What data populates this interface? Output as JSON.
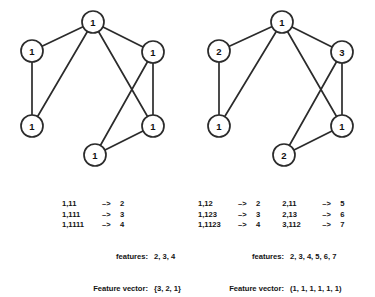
{
  "figure": {
    "background_color": "#ffffff",
    "ink_color": "#2b2b2b"
  },
  "graphs": [
    {
      "id": "left-graph",
      "name": "graph-left",
      "nodes": [
        {
          "id": "n-top",
          "label": "1",
          "cx": 93,
          "cy": 22,
          "r": 11
        },
        {
          "id": "n-upper-left",
          "label": "1",
          "cx": 32,
          "cy": 51,
          "r": 11
        },
        {
          "id": "n-upper-right",
          "label": "1",
          "cx": 153,
          "cy": 52,
          "r": 11
        },
        {
          "id": "n-lower-left",
          "label": "1",
          "cx": 32,
          "cy": 126,
          "r": 11
        },
        {
          "id": "n-lower-right",
          "label": "1",
          "cx": 153,
          "cy": 126,
          "r": 11
        },
        {
          "id": "n-bottom",
          "label": "1",
          "cx": 95,
          "cy": 155,
          "r": 11
        }
      ],
      "edges": [
        {
          "from": "n-top",
          "to": "n-upper-left"
        },
        {
          "from": "n-top",
          "to": "n-upper-right"
        },
        {
          "from": "n-top",
          "to": "n-lower-left"
        },
        {
          "from": "n-top",
          "to": "n-lower-right"
        },
        {
          "from": "n-upper-left",
          "to": "n-lower-left"
        },
        {
          "from": "n-upper-right",
          "to": "n-lower-right"
        },
        {
          "from": "n-upper-right",
          "to": "n-bottom"
        },
        {
          "from": "n-lower-right",
          "to": "n-bottom"
        }
      ]
    },
    {
      "id": "right-graph",
      "name": "graph-right",
      "nodes": [
        {
          "id": "n-top",
          "label": "1",
          "cx": 95,
          "cy": 22,
          "r": 11
        },
        {
          "id": "n-upper-left",
          "label": "2",
          "cx": 32,
          "cy": 51,
          "r": 11
        },
        {
          "id": "n-upper-right",
          "label": "3",
          "cx": 155,
          "cy": 52,
          "r": 11
        },
        {
          "id": "n-lower-left",
          "label": "1",
          "cx": 32,
          "cy": 126,
          "r": 11
        },
        {
          "id": "n-lower-right",
          "label": "1",
          "cx": 155,
          "cy": 126,
          "r": 11
        },
        {
          "id": "n-bottom",
          "label": "2",
          "cx": 97,
          "cy": 155,
          "r": 11
        }
      ],
      "edges": [
        {
          "from": "n-top",
          "to": "n-upper-left"
        },
        {
          "from": "n-top",
          "to": "n-upper-right"
        },
        {
          "from": "n-top",
          "to": "n-lower-left"
        },
        {
          "from": "n-top",
          "to": "n-lower-right"
        },
        {
          "from": "n-upper-left",
          "to": "n-lower-left"
        },
        {
          "from": "n-upper-right",
          "to": "n-lower-right"
        },
        {
          "from": "n-upper-right",
          "to": "n-bottom"
        },
        {
          "from": "n-lower-right",
          "to": "n-bottom"
        }
      ]
    }
  ],
  "captions": {
    "left": {
      "rules_col1": [
        {
          "pattern": "1,11",
          "arrow": "–> ",
          "result": "2"
        },
        {
          "pattern": "1,111",
          "arrow": "–> ",
          "result": "3"
        },
        {
          "pattern": "1,1111",
          "arrow": "–> ",
          "result": "4"
        }
      ],
      "features_label": "features:",
      "features_value": "2, 3, 4",
      "vector_label": "Feature vector:",
      "vector_value": "{3, 2, 1}"
    },
    "right": {
      "rules_col1": [
        {
          "pattern": "1,12",
          "arrow": "–> ",
          "result": "2"
        },
        {
          "pattern": "1,123",
          "arrow": "–> ",
          "result": "3"
        },
        {
          "pattern": "1,1123",
          "arrow": "–> ",
          "result": "4"
        }
      ],
      "rules_col2": [
        {
          "pattern": "2,11",
          "arrow": "–> ",
          "result": "5"
        },
        {
          "pattern": "2,13",
          "arrow": "–> ",
          "result": "6"
        },
        {
          "pattern": "3,112",
          "arrow": "–> ",
          "result": "7"
        }
      ],
      "features_label": "features:",
      "features_value": "2, 3, 4, 5, 6, 7",
      "vector_label": "Feature vector:",
      "vector_value": "(1, 1, 1, 1, 1, 1)"
    }
  }
}
